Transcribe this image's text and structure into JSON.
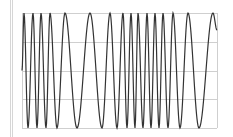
{
  "chart_data": {
    "type": "line",
    "title": "",
    "xlabel": "",
    "ylabel": "",
    "ylim": [
      -1,
      1
    ],
    "grid": true,
    "legend": null,
    "y_gridlines": [
      1,
      0.5,
      0,
      -0.5,
      -1
    ],
    "extrema_x_px": [
      {
        "x": 22,
        "y": 0
      },
      {
        "x": 24,
        "y": 1
      },
      {
        "x": 28,
        "y": -1
      },
      {
        "x": 33,
        "y": 1
      },
      {
        "x": 37,
        "y": -1
      },
      {
        "x": 41,
        "y": 1
      },
      {
        "x": 46,
        "y": -1
      },
      {
        "x": 50,
        "y": 1
      },
      {
        "x": 57,
        "y": -1
      },
      {
        "x": 65,
        "y": 1
      },
      {
        "x": 77,
        "y": -1
      },
      {
        "x": 90,
        "y": 1
      },
      {
        "x": 102,
        "y": -1
      },
      {
        "x": 110,
        "y": 1
      },
      {
        "x": 117,
        "y": -1
      },
      {
        "x": 123,
        "y": 1
      },
      {
        "x": 127,
        "y": -1
      },
      {
        "x": 131,
        "y": 1
      },
      {
        "x": 135,
        "y": -1
      },
      {
        "x": 138,
        "y": 1
      },
      {
        "x": 143,
        "y": -1
      },
      {
        "x": 147,
        "y": 1
      },
      {
        "x": 151,
        "y": -1
      },
      {
        "x": 155,
        "y": 1
      },
      {
        "x": 159,
        "y": -1
      },
      {
        "x": 163,
        "y": 1
      },
      {
        "x": 168,
        "y": -1
      },
      {
        "x": 173,
        "y": 1
      },
      {
        "x": 180,
        "y": -1
      },
      {
        "x": 188,
        "y": 1
      },
      {
        "x": 199,
        "y": -1
      },
      {
        "x": 213,
        "y": 1
      },
      {
        "x": 217,
        "y": 0.7
      }
    ]
  },
  "colors": {
    "line": "#333333",
    "grid": "#cfcfcf",
    "edge": "#d6d6d6",
    "background": "#ffffff"
  },
  "plot_area": {
    "left": 22,
    "right": 217,
    "top": 13,
    "bottom": 128
  }
}
